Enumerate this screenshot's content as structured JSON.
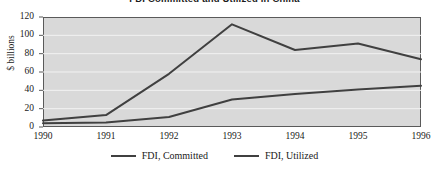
{
  "chart_data": {
    "type": "line",
    "title": "FDI Committed and Utilized in China",
    "xlabel": "",
    "ylabel": "$ billions",
    "categories": [
      "1990",
      "1991",
      "1992",
      "1993",
      "1994",
      "1995",
      "1996"
    ],
    "x": [
      1990,
      1991,
      1992,
      1993,
      1994,
      1995,
      1996
    ],
    "xlim": [
      1990,
      1996
    ],
    "ylim": [
      0,
      120
    ],
    "yticks": [
      0,
      20,
      40,
      60,
      80,
      100,
      120
    ],
    "ytick_labels": [
      "0",
      "20",
      "40",
      "60",
      "80",
      "100",
      "120"
    ],
    "grid": true,
    "grid_axis": "y",
    "grid_color": "#f2f2f2",
    "plot_background": "#d9d9d9",
    "legend_position": "bottom",
    "series": [
      {
        "name": "FDI, Committed",
        "color": "#404040",
        "values": [
          7,
          13,
          58,
          112,
          84,
          91,
          74
        ]
      },
      {
        "name": "FDI, Utilized",
        "color": "#404040",
        "values": [
          4,
          5,
          11,
          30,
          36,
          41,
          45
        ]
      }
    ]
  },
  "legend": {
    "items": [
      {
        "label": "FDI, Committed"
      },
      {
        "label": "FDI, Utilized"
      }
    ]
  }
}
